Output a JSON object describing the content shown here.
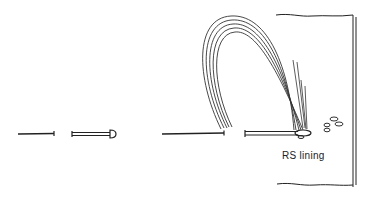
{
  "diagram": {
    "type": "sewing-illustration",
    "steps": [
      {
        "id": "step-1",
        "description": "needle"
      },
      {
        "id": "step-2",
        "description": "needle with head (pin)"
      },
      {
        "id": "step-3",
        "description": "needle with threaded loop through lining"
      }
    ],
    "labels": {
      "fabric": "RS lining"
    },
    "colors": {
      "ink": "#222222",
      "background": "#ffffff"
    }
  }
}
